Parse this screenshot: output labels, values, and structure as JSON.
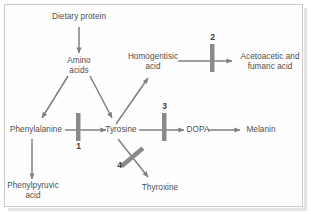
{
  "diagram": {
    "frame_border_color": "#c9c9c9",
    "background_color": "#ffffff",
    "text_color": "#4d4d4d",
    "arrow_color": "#808080",
    "block_color": "#8a8a8a",
    "nodes": [
      {
        "id": "dietary_protein",
        "label": "Dietary protein"
      },
      {
        "id": "amino_acids",
        "label": "Amino\nacids"
      },
      {
        "id": "homogentisic_acid",
        "label": "Homogentisic\nacid"
      },
      {
        "id": "acetoacetic",
        "label": "Acetoacetic and\nfumaric acid"
      },
      {
        "id": "phenylalanine",
        "label": "Phenylalanine"
      },
      {
        "id": "tyrosine",
        "label": "Tyrosine"
      },
      {
        "id": "dopa",
        "label": "DOPA"
      },
      {
        "id": "melanin",
        "label": "Melanin"
      },
      {
        "id": "phenylpyruvic",
        "label": "Phenylpyruvic\nacid"
      },
      {
        "id": "thyroxine",
        "label": "Thyroxine"
      }
    ],
    "blocks": [
      {
        "id": "block1",
        "label": "1",
        "on": "phenylalanine-to-tyrosine",
        "orientation": "vertical"
      },
      {
        "id": "block2",
        "label": "2",
        "on": "homogentisic-to-acetoacetic",
        "orientation": "vertical"
      },
      {
        "id": "block3",
        "label": "3",
        "on": "tyrosine-to-dopa",
        "orientation": "vertical"
      },
      {
        "id": "block4",
        "label": "4",
        "on": "tyrosine-to-thyroxine",
        "orientation": "diagonal"
      }
    ],
    "arrows": [
      {
        "from": "dietary_protein",
        "to": "amino_acids"
      },
      {
        "from": "amino_acids",
        "to": "phenylalanine"
      },
      {
        "from": "amino_acids",
        "to": "tyrosine"
      },
      {
        "from": "phenylalanine",
        "to": "tyrosine"
      },
      {
        "from": "phenylalanine",
        "to": "phenylpyruvic"
      },
      {
        "from": "tyrosine",
        "to": "homogentisic_acid"
      },
      {
        "from": "tyrosine",
        "to": "dopa"
      },
      {
        "from": "tyrosine",
        "to": "thyroxine"
      },
      {
        "from": "homogentisic_acid",
        "to": "acetoacetic"
      },
      {
        "from": "dopa",
        "to": "melanin"
      }
    ]
  }
}
